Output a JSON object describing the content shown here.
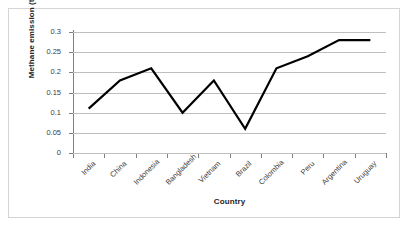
{
  "chart_data": {
    "type": "line",
    "title": "",
    "xlabel": "Country",
    "ylabel": "Methane emission (t/ha)",
    "categories": [
      "India",
      "China",
      "Indonesia",
      "Bangladesh",
      "Vietnam",
      "Brazil",
      "Colombia",
      "Peru",
      "Argentina",
      "Uruguay"
    ],
    "values": [
      0.11,
      0.18,
      0.21,
      0.1,
      0.18,
      0.06,
      0.21,
      0.24,
      0.28,
      0.28
    ],
    "series": [
      {
        "name": "Methane emission",
        "values": [
          0.11,
          0.18,
          0.21,
          0.1,
          0.18,
          0.06,
          0.21,
          0.24,
          0.28,
          0.28
        ]
      }
    ],
    "ylim": [
      0,
      0.3
    ],
    "ytick_labels": [
      "0",
      "0.05",
      "0.1",
      "0.15",
      "0.2",
      "0.25",
      "0.3"
    ],
    "ytick_values": [
      0,
      0.05,
      0.1,
      0.15,
      0.2,
      0.25,
      0.3
    ],
    "grid": true,
    "grid_axis": "y",
    "legend": false,
    "legend_position": "none",
    "line_color": "#000000",
    "line_width": 2.2,
    "grid_color": "#bfbfbf",
    "axis_color": "#7f7f7f",
    "background_color": "#ffffff",
    "border_color": "#d4d4d4",
    "markers": false,
    "xtick_rotation": -45
  }
}
